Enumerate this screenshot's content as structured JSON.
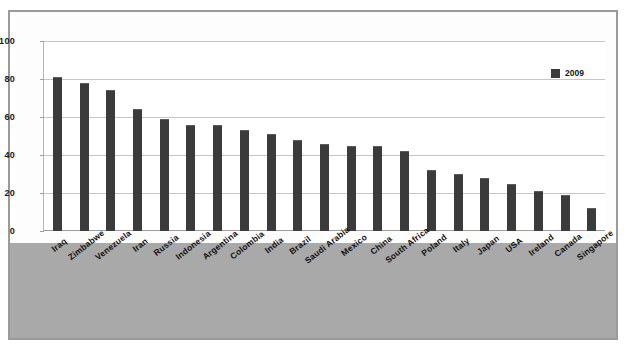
{
  "chart_data": {
    "type": "bar",
    "title": "",
    "xlabel": "",
    "ylabel": "",
    "ylim": [
      0,
      100
    ],
    "yticks": [
      0,
      20,
      40,
      60,
      80,
      100
    ],
    "grid": true,
    "legend_position": "top-right",
    "series_name": "2009",
    "bar_color": "#3b3b3b",
    "categories": [
      "Iraq",
      "Zimbabwe",
      "Venezuela",
      "Iran",
      "Russia",
      "Indonesia",
      "Argentina",
      "Colombia",
      "India",
      "Brazil",
      "Saudi Arabia",
      "Mexico",
      "China",
      "South Africa",
      "Poland",
      "Italy",
      "Japan",
      "USA",
      "Ireland",
      "Canada",
      "Singapore"
    ],
    "values": [
      81,
      78,
      74,
      64,
      59,
      56,
      56,
      53,
      51,
      48,
      46,
      45,
      45,
      42,
      32,
      30,
      28,
      25,
      21,
      19,
      12
    ],
    "series": [
      {
        "name": "2009",
        "values": [
          81,
          78,
          74,
          64,
          59,
          56,
          56,
          53,
          51,
          48,
          46,
          45,
          45,
          42,
          32,
          30,
          28,
          25,
          21,
          19,
          12
        ]
      }
    ]
  },
  "legend": {
    "entries": [
      {
        "label": "2009",
        "color": "#3b3b3b"
      }
    ]
  },
  "style": {
    "frame_color": "#9a9a9a",
    "label_band_color": "#a9a9a9",
    "gridline_color": "#c6c6c6",
    "plot_background": "#ffffff"
  }
}
